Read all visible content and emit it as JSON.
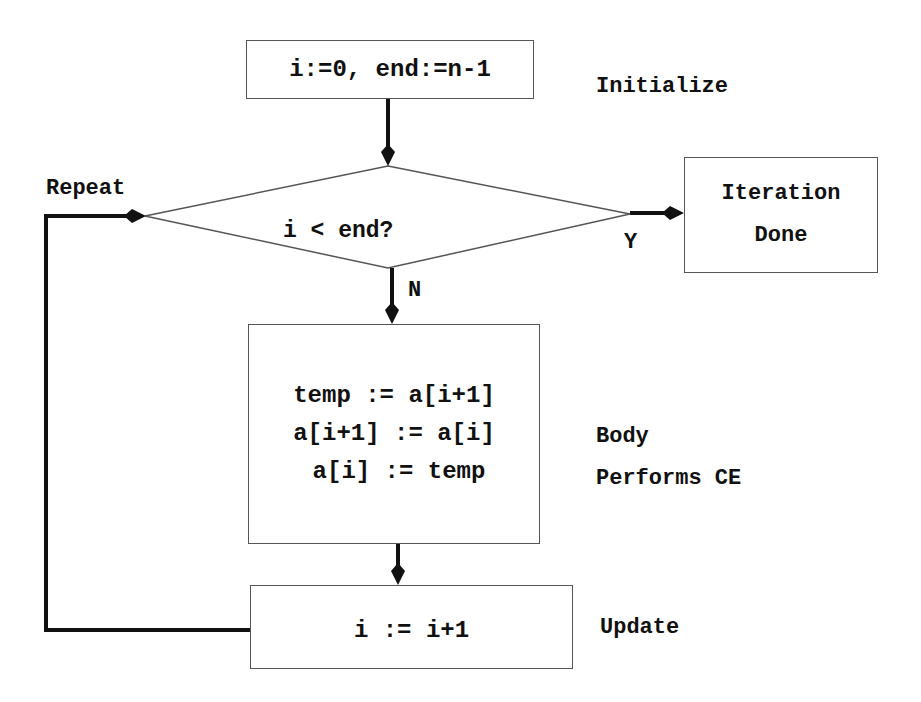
{
  "diagram": {
    "type": "flowchart",
    "nodes": {
      "init": {
        "text": "i:=0, end:=n-1",
        "side_label": "Initialize"
      },
      "condition": {
        "text": "i < end?",
        "yes_label": "Y",
        "no_label": "N",
        "loop_label": "Repeat"
      },
      "done": {
        "line1": "Iteration",
        "line2": "Done"
      },
      "body": {
        "lines": [
          "temp := a[i+1]",
          "a[i+1] := a[i]",
          "a[i] := temp"
        ],
        "side_label_1": "Body",
        "side_label_2": "Performs CE"
      },
      "update": {
        "text": "i := i+1",
        "side_label": "Update"
      }
    },
    "edges": [
      {
        "from": "init",
        "to": "condition",
        "label": ""
      },
      {
        "from": "condition",
        "to": "done",
        "label": "Y"
      },
      {
        "from": "condition",
        "to": "body",
        "label": "N"
      },
      {
        "from": "body",
        "to": "update",
        "label": ""
      },
      {
        "from": "update",
        "to": "condition",
        "label": "Repeat"
      }
    ],
    "colors": {
      "stroke": "#111111",
      "box_border": "#555555",
      "background": "#ffffff"
    }
  }
}
